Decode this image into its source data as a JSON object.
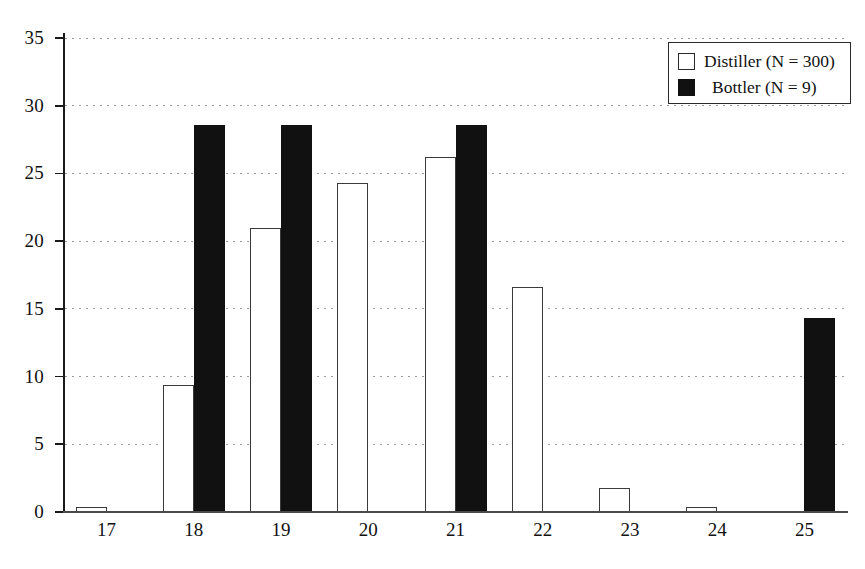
{
  "chart_data": {
    "type": "bar",
    "title": "",
    "subtitle": "",
    "xlabel": "",
    "ylabel": "",
    "categories": [
      "17",
      "18",
      "19",
      "20",
      "21",
      "22",
      "23",
      "24",
      "25"
    ],
    "series": [
      {
        "name": "Distiller (N = 300)",
        "key": "distiller",
        "style": "open-white-bar",
        "color": "#ffffff",
        "edge_color": "#3a3a3a",
        "values": [
          0.4,
          9.4,
          21.0,
          24.3,
          26.2,
          16.6,
          1.8,
          0.4,
          0
        ]
      },
      {
        "name": "Bottler (N = 9)",
        "key": "bottler",
        "style": "solid-black-bar",
        "color": "#111111",
        "edge_color": "#111111",
        "values": [
          0,
          28.6,
          28.6,
          0,
          28.6,
          0,
          0,
          0,
          14.3
        ]
      }
    ],
    "ylim": [
      0,
      35
    ],
    "yticks": [
      0,
      5,
      10,
      15,
      20,
      25,
      30,
      35
    ],
    "ytick_labels": [
      "0",
      "5",
      "10",
      "15",
      "20",
      "25",
      "30",
      "35"
    ],
    "xtick_labels": [
      "17",
      "18",
      "19",
      "20",
      "21",
      "22",
      "23",
      "24",
      "25"
    ],
    "grid": "horizontal-dotted",
    "legend_position": "top-right",
    "legend_entries": [
      "Distiller (N = 300)",
      "Bottler (N = 9)"
    ]
  },
  "legend": {
    "items": [
      {
        "label": "Distiller (N = 300)",
        "swatch": "open-square-swatch"
      },
      {
        "label": "Bottler (N = 9)",
        "swatch": "filled-square-swatch"
      }
    ]
  },
  "axes": {
    "y_ticks": [
      "0",
      "5",
      "10",
      "15",
      "20",
      "25",
      "30",
      "35"
    ],
    "x_ticks": [
      "17",
      "18",
      "19",
      "20",
      "21",
      "22",
      "23",
      "24",
      "25"
    ]
  }
}
